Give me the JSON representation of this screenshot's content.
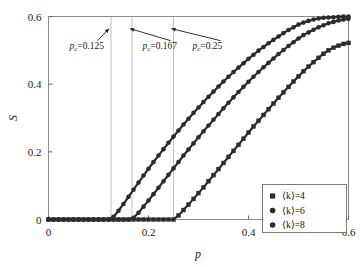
{
  "figure": {
    "background_color": "#ffffff",
    "frame_color": "#8a8a8a",
    "marker_color": "#2b2b2b"
  },
  "chart_data": {
    "type": "scatter",
    "title": "",
    "xlabel": "p",
    "ylabel": "S",
    "xlim": [
      0,
      0.6
    ],
    "ylim": [
      0,
      0.6
    ],
    "xticks": [
      0,
      0.2,
      0.4,
      0.6
    ],
    "xtick_labels": [
      "0",
      "0.2",
      "0.4",
      "0.6"
    ],
    "yticks": [
      0,
      0.2,
      0.4,
      0.6
    ],
    "ytick_labels": [
      "0",
      "0.2",
      "0.4",
      "0.6"
    ],
    "grid": false,
    "legend_position": "lower right",
    "series": [
      {
        "name": "⟨k⟩=4",
        "marker": "square",
        "threshold": 0.25,
        "x": [
          0.0,
          0.01,
          0.02,
          0.03,
          0.04,
          0.05,
          0.06,
          0.07,
          0.08,
          0.09,
          0.1,
          0.11,
          0.12,
          0.13,
          0.14,
          0.15,
          0.16,
          0.17,
          0.18,
          0.19,
          0.2,
          0.21,
          0.22,
          0.23,
          0.24,
          0.25,
          0.26,
          0.27,
          0.28,
          0.29,
          0.3,
          0.31,
          0.32,
          0.33,
          0.34,
          0.35,
          0.36,
          0.37,
          0.38,
          0.39,
          0.4,
          0.41,
          0.42,
          0.43,
          0.44,
          0.45,
          0.46,
          0.47,
          0.48,
          0.49,
          0.5,
          0.51,
          0.52,
          0.53,
          0.54,
          0.55,
          0.56,
          0.57,
          0.58,
          0.59,
          0.6
        ],
        "y": [
          0.0,
          0.0,
          0.0,
          0.0,
          0.0,
          0.0,
          0.0,
          0.0,
          0.0,
          0.0,
          0.0,
          0.0,
          0.0,
          0.0,
          0.0,
          0.0,
          0.0,
          0.0,
          0.0,
          0.0,
          0.0,
          0.0,
          0.0,
          0.0,
          0.0,
          0.0,
          0.012,
          0.028,
          0.044,
          0.061,
          0.078,
          0.095,
          0.113,
          0.131,
          0.149,
          0.167,
          0.185,
          0.203,
          0.221,
          0.239,
          0.257,
          0.275,
          0.292,
          0.309,
          0.326,
          0.343,
          0.36,
          0.376,
          0.392,
          0.408,
          0.423,
          0.438,
          0.452,
          0.465,
          0.478,
          0.49,
          0.5,
          0.508,
          0.514,
          0.519,
          0.522
        ]
      },
      {
        "name": "⟨k⟩=6",
        "marker": "circle",
        "threshold": 0.167,
        "x": [
          0.0,
          0.01,
          0.02,
          0.03,
          0.04,
          0.05,
          0.06,
          0.07,
          0.08,
          0.09,
          0.1,
          0.11,
          0.12,
          0.13,
          0.14,
          0.15,
          0.16,
          0.17,
          0.18,
          0.19,
          0.2,
          0.21,
          0.22,
          0.23,
          0.24,
          0.25,
          0.26,
          0.27,
          0.28,
          0.29,
          0.3,
          0.31,
          0.32,
          0.33,
          0.34,
          0.35,
          0.36,
          0.37,
          0.38,
          0.39,
          0.4,
          0.41,
          0.42,
          0.43,
          0.44,
          0.45,
          0.46,
          0.47,
          0.48,
          0.49,
          0.5,
          0.51,
          0.52,
          0.53,
          0.54,
          0.55,
          0.56,
          0.57,
          0.58,
          0.59,
          0.6
        ],
        "y": [
          0.0,
          0.0,
          0.0,
          0.0,
          0.0,
          0.0,
          0.0,
          0.0,
          0.0,
          0.0,
          0.0,
          0.0,
          0.0,
          0.0,
          0.0,
          0.0,
          0.0,
          0.005,
          0.02,
          0.038,
          0.056,
          0.075,
          0.094,
          0.113,
          0.132,
          0.151,
          0.17,
          0.189,
          0.207,
          0.225,
          0.243,
          0.261,
          0.278,
          0.295,
          0.312,
          0.329,
          0.345,
          0.361,
          0.377,
          0.392,
          0.407,
          0.422,
          0.436,
          0.45,
          0.463,
          0.476,
          0.489,
          0.501,
          0.513,
          0.524,
          0.535,
          0.545,
          0.553,
          0.561,
          0.568,
          0.574,
          0.58,
          0.584,
          0.588,
          0.591,
          0.593
        ]
      },
      {
        "name": "⟨k⟩=8",
        "marker": "circle",
        "threshold": 0.125,
        "x": [
          0.0,
          0.01,
          0.02,
          0.03,
          0.04,
          0.05,
          0.06,
          0.07,
          0.08,
          0.09,
          0.1,
          0.11,
          0.12,
          0.13,
          0.14,
          0.15,
          0.16,
          0.17,
          0.18,
          0.19,
          0.2,
          0.21,
          0.22,
          0.23,
          0.24,
          0.25,
          0.26,
          0.27,
          0.28,
          0.29,
          0.3,
          0.31,
          0.32,
          0.33,
          0.34,
          0.35,
          0.36,
          0.37,
          0.38,
          0.39,
          0.4,
          0.41,
          0.42,
          0.43,
          0.44,
          0.45,
          0.46,
          0.47,
          0.48,
          0.49,
          0.5,
          0.51,
          0.52,
          0.53,
          0.54,
          0.55,
          0.56,
          0.57,
          0.58,
          0.59,
          0.6
        ],
        "y": [
          0.0,
          0.0,
          0.0,
          0.0,
          0.0,
          0.0,
          0.0,
          0.0,
          0.0,
          0.0,
          0.0,
          0.0,
          0.0,
          0.008,
          0.026,
          0.046,
          0.067,
          0.088,
          0.109,
          0.13,
          0.15,
          0.17,
          0.189,
          0.208,
          0.227,
          0.245,
          0.263,
          0.281,
          0.298,
          0.315,
          0.331,
          0.347,
          0.363,
          0.378,
          0.393,
          0.408,
          0.422,
          0.436,
          0.449,
          0.462,
          0.475,
          0.487,
          0.499,
          0.51,
          0.521,
          0.531,
          0.541,
          0.551,
          0.56,
          0.568,
          0.576,
          0.582,
          0.587,
          0.591,
          0.594,
          0.596,
          0.597,
          0.598,
          0.599,
          0.5995,
          0.6
        ]
      }
    ],
    "annotations": [
      {
        "id": "pc-125",
        "label_prefix": "p",
        "label_sub": "c",
        "label_value": "=0.125",
        "x": 0.125,
        "text_x": 0.042,
        "text_y": 0.505
      },
      {
        "id": "pc-167",
        "label_prefix": "p",
        "label_sub": "c",
        "label_value": "=0.167",
        "x": 0.167,
        "text_x": 0.188,
        "text_y": 0.505
      },
      {
        "id": "pc-25",
        "label_prefix": "p",
        "label_sub": "c",
        "label_value": "=0.25",
        "x": 0.25,
        "text_x": 0.288,
        "text_y": 0.505
      }
    ],
    "vertical_lines": [
      0.125,
      0.167,
      0.25
    ]
  },
  "legend": {
    "entries": [
      {
        "label": "⟨k⟩=4",
        "marker": "square"
      },
      {
        "label": "⟨k⟩=6",
        "marker": "circle"
      },
      {
        "label": "⟨k⟩=8",
        "marker": "circle"
      }
    ]
  }
}
